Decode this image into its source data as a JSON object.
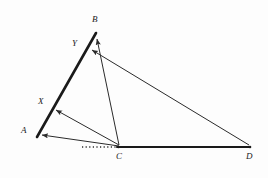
{
  "figure": {
    "canvas": {
      "width": 268,
      "height": 178
    },
    "colors": {
      "background": "#fdfdfd",
      "stroke": "#2b2b2b",
      "thick_stroke": "#1a1a1a",
      "label": "#1a1a1a"
    },
    "points": {
      "A": {
        "x": 37,
        "y": 137,
        "label": "A",
        "label_x": 21,
        "label_y": 126
      },
      "B": {
        "x": 96,
        "y": 33,
        "label": "B",
        "label_x": 92,
        "label_y": 15
      },
      "C": {
        "x": 119,
        "y": 147,
        "label": "C",
        "label_x": 116,
        "label_y": 152
      },
      "D": {
        "x": 250,
        "y": 147,
        "label": "D",
        "label_x": 246,
        "label_y": 152
      },
      "X": {
        "x": 51,
        "y": 112,
        "label": "X",
        "label_x": 38,
        "label_y": 97
      },
      "Y": {
        "x": 87,
        "y": 49,
        "label": "Y",
        "label_x": 72,
        "label_y": 39
      }
    },
    "segments": [
      {
        "name": "segment-AB",
        "from": "A",
        "to": "B",
        "style": "thick",
        "width": 2.6,
        "arrow": "none"
      },
      {
        "name": "segment-CD",
        "from": "C",
        "to": "D",
        "style": "thick",
        "width": 2.2,
        "arrow": "none"
      },
      {
        "name": "segment-C-to-A",
        "from": "C",
        "to": "A",
        "style": "thin",
        "width": 1.0,
        "arrow": "end"
      },
      {
        "name": "segment-C-to-X",
        "from": "C",
        "to": "X",
        "style": "thin",
        "width": 1.0,
        "arrow": "end"
      },
      {
        "name": "segment-C-to-B",
        "from": "C",
        "to": "B",
        "style": "thin",
        "width": 1.0,
        "arrow": "end"
      },
      {
        "name": "segment-D-to-Y",
        "from": "D",
        "to": "Y",
        "style": "thin",
        "width": 1.0,
        "arrow": "end"
      }
    ],
    "dotted_segment": {
      "name": "dotted-baseline-left-of-C",
      "from_x": 82,
      "to_x": 117,
      "y": 147,
      "dash": "1.2 2.4",
      "width": 1.6
    },
    "labels": [
      {
        "name": "vertex-label-A",
        "text": "A"
      },
      {
        "name": "vertex-label-B",
        "text": "B"
      },
      {
        "name": "vertex-label-C",
        "text": "C"
      },
      {
        "name": "vertex-label-D",
        "text": "D"
      },
      {
        "name": "vertex-label-X",
        "text": "X"
      },
      {
        "name": "vertex-label-Y",
        "text": "Y"
      }
    ]
  }
}
